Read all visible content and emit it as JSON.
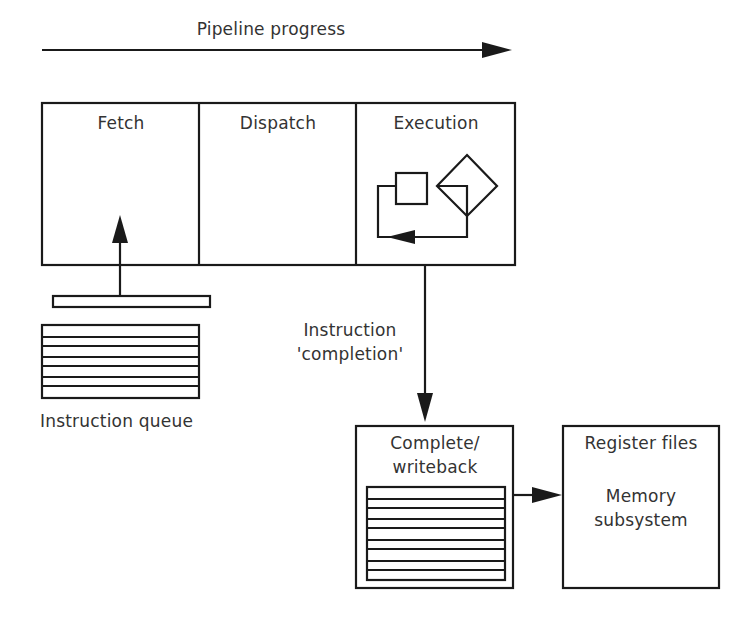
{
  "diagram": {
    "title_arrow": {
      "label": "Pipeline progress"
    },
    "stages": [
      {
        "label": "Fetch"
      },
      {
        "label": "Dispatch"
      },
      {
        "label": "Execution"
      }
    ],
    "instruction_queue": {
      "label": "Instruction queue",
      "rows": 8
    },
    "completion_arrow": {
      "line1": "Instruction",
      "line2": "'completion'"
    },
    "complete_writeback": {
      "line1": "Complete/",
      "line2": "writeback",
      "rows": 9
    },
    "register_files": {
      "line1": "Register files",
      "line2": "Memory",
      "line3": "subsystem"
    },
    "colors": {
      "stroke": "#1a1a1a",
      "text": "#333333",
      "background": "#ffffff"
    }
  }
}
